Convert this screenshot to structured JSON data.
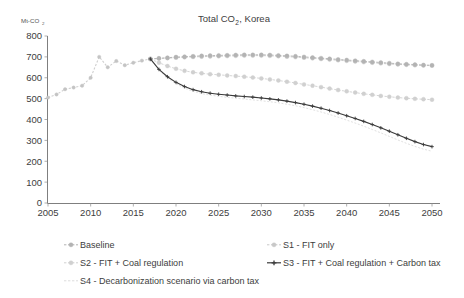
{
  "chart_data": {
    "type": "line",
    "title_main": "Total CO",
    "title_sub": "2",
    "title_tail": ", Korea",
    "ylabel": "Mt-CO2",
    "ylabel_main": "Mt-CO",
    "ylabel_sub": "2",
    "xlabel": "",
    "ylim": [
      0,
      800
    ],
    "ytick_labels": [
      "800",
      "700",
      "600",
      "500",
      "400",
      "300",
      "200",
      "100",
      "0"
    ],
    "yticks": [
      800,
      700,
      600,
      500,
      400,
      300,
      200,
      100,
      0
    ],
    "xlim": [
      2005,
      2050
    ],
    "xtick_labels": [
      "2005",
      "2010",
      "2015",
      "2020",
      "2025",
      "2030",
      "2035",
      "2040",
      "2045",
      "2050"
    ],
    "xticks": [
      2005,
      2010,
      2015,
      2020,
      2025,
      2030,
      2035,
      2040,
      2045,
      2050
    ],
    "grid": false,
    "legend_position": "bottom",
    "x_history": [
      2005,
      2006,
      2007,
      2008,
      2009,
      2010,
      2011,
      2012,
      2013,
      2014,
      2015,
      2016,
      2017
    ],
    "history_values": [
      505,
      520,
      545,
      553,
      562,
      600,
      700,
      650,
      680,
      660,
      672,
      682,
      690
    ],
    "x_projection": [
      2017,
      2018,
      2019,
      2020,
      2021,
      2022,
      2023,
      2024,
      2025,
      2026,
      2027,
      2028,
      2029,
      2030,
      2031,
      2032,
      2033,
      2034,
      2035,
      2036,
      2037,
      2038,
      2039,
      2040,
      2041,
      2042,
      2043,
      2044,
      2045,
      2046,
      2047,
      2048,
      2049,
      2050
    ],
    "series": [
      {
        "name": "Baseline",
        "color": "#b3b3b3",
        "marker": "circle",
        "values": [
          690,
          693,
          696,
          699,
          701,
          703,
          705,
          706,
          707,
          708,
          709,
          710,
          710,
          710,
          709,
          707,
          705,
          703,
          700,
          697,
          694,
          691,
          688,
          685,
          682,
          679,
          676,
          673,
          670,
          667,
          665,
          663,
          661,
          660
        ]
      },
      {
        "name": "S1 - FIT only",
        "color": "#c8c8c8",
        "marker": "circle",
        "values": [
          690,
          692,
          694,
          696,
          698,
          700,
          701,
          702,
          703,
          704,
          705,
          706,
          706,
          706,
          705,
          703,
          701,
          699,
          696,
          693,
          690,
          687,
          684,
          681,
          678,
          675,
          672,
          669,
          666,
          664,
          662,
          660,
          659,
          658
        ]
      },
      {
        "name": "S2 - FIT + Coal regulation",
        "color": "#d0d0d0",
        "marker": "circle",
        "values": [
          690,
          672,
          656,
          643,
          633,
          626,
          621,
          617,
          614,
          611,
          608,
          605,
          601,
          597,
          592,
          587,
          581,
          575,
          568,
          562,
          555,
          548,
          541,
          535,
          529,
          523,
          518,
          513,
          509,
          505,
          502,
          499,
          497,
          495
        ]
      },
      {
        "name": "S3 - FIT + Coal regulation + Carbon tax",
        "color": "#3a3a3a",
        "marker": "cross",
        "values": [
          690,
          640,
          605,
          578,
          558,
          543,
          533,
          526,
          521,
          517,
          513,
          510,
          507,
          503,
          499,
          494,
          488,
          481,
          473,
          464,
          454,
          443,
          431,
          418,
          405,
          391,
          376,
          360,
          344,
          327,
          310,
          294,
          280,
          270
        ]
      },
      {
        "name": "S4 - Decarbonization scenario via carbon tax",
        "color": "#dcdcdc",
        "marker": "none",
        "values": [
          690,
          636,
          599,
          571,
          550,
          535,
          524,
          517,
          511,
          506,
          502,
          498,
          494,
          490,
          485,
          480,
          473,
          466,
          457,
          447,
          436,
          424,
          411,
          397,
          383,
          368,
          352,
          336,
          319,
          302,
          286,
          271,
          258,
          248
        ]
      }
    ],
    "legend": [
      {
        "label": "Baseline",
        "color": "#b3b3b3",
        "marker": "circle"
      },
      {
        "label": "S1 - FIT only",
        "color": "#c8c8c8",
        "marker": "circle"
      },
      {
        "label": "S2 - FIT + Coal regulation",
        "color": "#d0d0d0",
        "marker": "circle"
      },
      {
        "label": "S3 - FIT + Coal regulation + Carbon tax",
        "color": "#3a3a3a",
        "marker": "cross"
      },
      {
        "label": "S4 - Decarbonization scenario via carbon tax",
        "color": "#dcdcdc",
        "marker": "none"
      }
    ]
  }
}
